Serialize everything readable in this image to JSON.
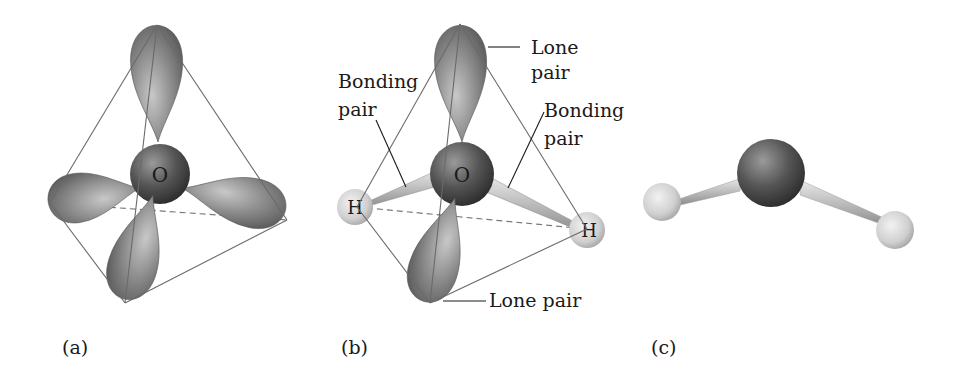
{
  "panels": [
    {
      "id": "a",
      "caption": "(a)",
      "central_atom": "O",
      "description": "Tetrahedral arrangement of four electron-pair orbitals around oxygen"
    },
    {
      "id": "b",
      "caption": "(b)",
      "central_atom": "O",
      "hydrogen_label": "H",
      "labels": {
        "lone_pair_top_line1": "Lone",
        "lone_pair_top_line2": "pair",
        "bonding_pair_left_line1": "Bonding",
        "bonding_pair_left_line2": "pair",
        "bonding_pair_right_line1": "Bonding",
        "bonding_pair_right_line2": "pair",
        "lone_pair_bottom": "Lone pair"
      }
    },
    {
      "id": "c",
      "caption": "(c)",
      "description": "Bent ball-and-stick model of water molecule"
    }
  ],
  "colors": {
    "orbital": "#8a8a8a",
    "oxygen": "#5a5a5a",
    "hydrogen": "#d6d6d6",
    "edge": "#6a6a6a"
  }
}
